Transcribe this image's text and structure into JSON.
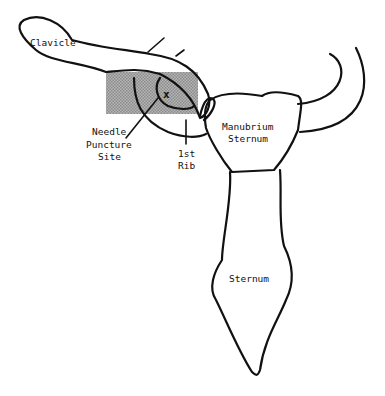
{
  "diagram": {
    "title": "",
    "labels": {
      "clavicle": "Clavicle",
      "needle_line1": "Needle",
      "needle_line2": "Puncture",
      "needle_line3": "Site",
      "rib_line1": "1st",
      "rib_line2": "Rib",
      "manubrium_line1": "Manubrium",
      "manubrium_line2": "Sternum",
      "sternum": "Sternum"
    },
    "markers": {
      "puncture_mark": "x"
    },
    "colors": {
      "outline": "#111111",
      "shaded_region": "#a8a8a8",
      "background": "#ffffff"
    }
  }
}
